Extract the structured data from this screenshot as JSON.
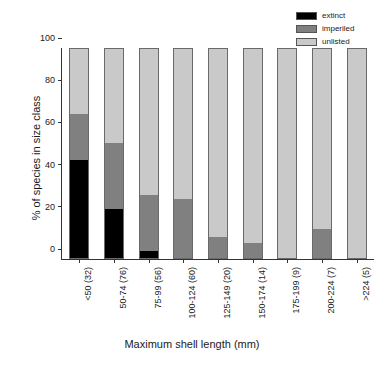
{
  "chart_data": {
    "type": "bar",
    "stacked": true,
    "title": "",
    "xlabel": "Maximum shell length (mm)",
    "ylabel": "% of species in size class",
    "ylim": [
      0,
      100
    ],
    "yticks": [
      0,
      20,
      40,
      60,
      80,
      100
    ],
    "ytick_labels": [
      "0",
      "20",
      "40",
      "60",
      "80",
      "100"
    ],
    "grid": false,
    "legend_position": "top-right",
    "categories": [
      "<50 (32)",
      "50-74 (76)",
      "75-99 (56)",
      "100-124 (60)",
      "125-149 (20)",
      "150-174 (14)",
      "175-199 (9)",
      "200-224 (7)",
      ">224 (5)"
    ],
    "series": [
      {
        "name": "extinct",
        "color": "#000000",
        "values": [
          47,
          23.5,
          3.5,
          0,
          0,
          0,
          0,
          0,
          0
        ]
      },
      {
        "name": "imperiled",
        "color": "#808080",
        "values": [
          22,
          31.5,
          26.5,
          28,
          10,
          7,
          0,
          14,
          0
        ]
      },
      {
        "name": "unlisted",
        "color": "#c9c9c9",
        "values": [
          31,
          45,
          70,
          72,
          90,
          93,
          100,
          86,
          100
        ]
      }
    ],
    "legend": [
      {
        "label": "extinct",
        "color": "#000000"
      },
      {
        "label": "imperiled",
        "color": "#808080"
      },
      {
        "label": "unlisted",
        "color": "#c9c9c9"
      }
    ]
  }
}
